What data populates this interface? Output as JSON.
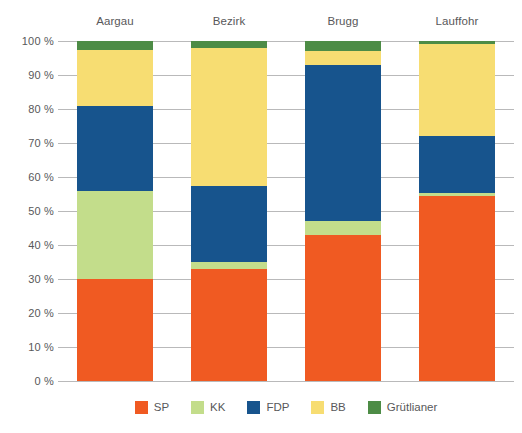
{
  "chart_data": {
    "type": "bar",
    "subtype": "stacked-percentage",
    "title": "",
    "xlabel": "",
    "ylabel": "",
    "ylim": [
      0,
      100
    ],
    "grid": true,
    "legend_position": "bottom",
    "categories": [
      "Aargau",
      "Bezirk",
      "Brugg",
      "Lauffohr"
    ],
    "tick_labels": [
      "0 %",
      "10 %",
      "20 %",
      "30 %",
      "40 %",
      "50 %",
      "60 %",
      "70 %",
      "80 %",
      "90 %",
      "100 %"
    ],
    "tick_values": [
      0,
      10,
      20,
      30,
      40,
      50,
      60,
      70,
      80,
      90,
      100
    ],
    "series": [
      {
        "name": "SP",
        "color": "#f05a22",
        "values": [
          30.0,
          33.0,
          43.0,
          54.5
        ]
      },
      {
        "name": "KK",
        "color": "#c3dd8b",
        "values": [
          26.0,
          2.0,
          4.0,
          0.8
        ]
      },
      {
        "name": "FDP",
        "color": "#17548d",
        "values": [
          25.0,
          22.5,
          46.0,
          16.7
        ]
      },
      {
        "name": "BB",
        "color": "#f7dd72",
        "values": [
          16.5,
          40.5,
          4.0,
          27.0
        ]
      },
      {
        "name": "Grütlianer",
        "color": "#4d8c46",
        "values": [
          2.5,
          2.0,
          3.0,
          1.0
        ]
      }
    ]
  },
  "axis": {
    "unit": "%",
    "colors": {
      "gridline": "#b9b9ba",
      "text": "#58585a"
    }
  }
}
